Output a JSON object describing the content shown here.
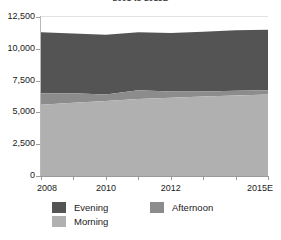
{
  "chart_data": {
    "type": "area",
    "stacked": true,
    "title": "2008 to 2015E",
    "xlabel": "",
    "ylabel": "",
    "ylim": [
      0,
      12500
    ],
    "yticks": [
      0,
      2500,
      5000,
      7500,
      10000,
      12500
    ],
    "ytick_labels": [
      "0",
      "2,500",
      "5,000",
      "7,500",
      "10,000",
      "12,500"
    ],
    "x": [
      "2008",
      "2009",
      "2010",
      "2011",
      "2012",
      "2013",
      "2014",
      "2015E"
    ],
    "xtick_labels_shown": [
      "2008",
      "",
      "2010",
      "",
      "2012",
      "",
      "",
      "2015E"
    ],
    "grid": false,
    "legend_position": "bottom",
    "series": [
      {
        "name": "Morning",
        "color": "#b0b0b0",
        "values": [
          5600,
          5750,
          5900,
          6050,
          6150,
          6250,
          6330,
          6400
        ]
      },
      {
        "name": "Afternoon",
        "color": "#8c8c8c",
        "values": [
          900,
          750,
          500,
          700,
          500,
          400,
          380,
          350
        ]
      },
      {
        "name": "Evening",
        "color": "#545454",
        "values": [
          4800,
          4700,
          4700,
          4550,
          4600,
          4700,
          4750,
          4750
        ]
      }
    ],
    "totals": [
      11300,
      11200,
      11100,
      11300,
      11250,
      11350,
      11460,
      11500
    ],
    "cumulative": {
      "morning_top": [
        5600,
        5750,
        5900,
        6050,
        6150,
        6250,
        6330,
        6400
      ],
      "afternoon_top": [
        6500,
        6500,
        6400,
        6750,
        6650,
        6650,
        6710,
        6750
      ],
      "evening_top": [
        11300,
        11200,
        11100,
        11300,
        11250,
        11350,
        11460,
        11500
      ]
    }
  },
  "legend": {
    "items": [
      {
        "label": "Evening",
        "color": "#545454"
      },
      {
        "label": "Afternoon",
        "color": "#8c8c8c"
      },
      {
        "label": "Morning",
        "color": "#b0b0b0"
      }
    ]
  },
  "colors": {
    "axis": "#9a9a9a",
    "gridline": "#e2e2e2",
    "text": "#1a1a1a",
    "background": "#ffffff"
  }
}
